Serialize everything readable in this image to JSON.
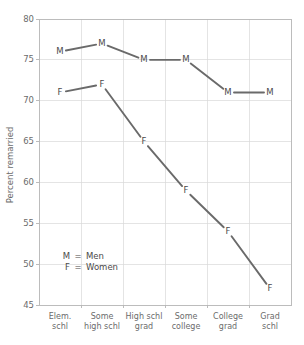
{
  "chart_data": {
    "type": "line",
    "title": "",
    "xlabel": "",
    "ylabel": "Percent remarried",
    "ylim": [
      45,
      80
    ],
    "yticks": [
      45,
      50,
      55,
      60,
      65,
      70,
      75,
      80
    ],
    "grid": true,
    "legend_position": "inside-lower-left",
    "categories": [
      "Elem. schl",
      "Some high schl",
      "High schl grad",
      "Some college",
      "College grad",
      "Grad schl"
    ],
    "category_lines": [
      [
        "Elem.",
        "schl"
      ],
      [
        "Some",
        "high schl"
      ],
      [
        "High schl",
        "grad"
      ],
      [
        "Some",
        "college"
      ],
      [
        "College",
        "grad"
      ],
      [
        "Grad",
        "schl"
      ]
    ],
    "series": [
      {
        "name": "Men",
        "marker": "M",
        "color": "#6a6a6a",
        "values": [
          76,
          77,
          75,
          75,
          71,
          71
        ]
      },
      {
        "name": "Women",
        "marker": "F",
        "color": "#6a6a6a",
        "values": [
          71,
          72,
          65,
          59,
          54,
          47
        ]
      }
    ],
    "legend": [
      {
        "key": "M",
        "eq": "=",
        "label": "Men"
      },
      {
        "key": "F",
        "eq": "=",
        "label": "Women"
      }
    ],
    "colors": {
      "line": "#6a6a6a",
      "grid": "#d8d8d8",
      "frame": "#b5b5b5",
      "text": "#6b6b6b",
      "background": "#ffffff"
    }
  }
}
